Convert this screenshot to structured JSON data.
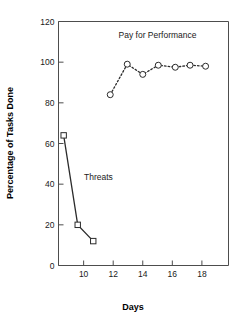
{
  "chart_data": {
    "type": "line",
    "title": "",
    "xlabel": "Days",
    "ylabel": "Percentage of Tasks Done",
    "xlim": [
      8.3,
      19.8
    ],
    "ylim": [
      0,
      120
    ],
    "xticks": [
      10,
      12,
      14,
      16,
      18
    ],
    "yticks": [
      0,
      20,
      40,
      60,
      80,
      100,
      120
    ],
    "xtick_labels": [
      "10",
      "12",
      "14",
      "16",
      "18"
    ],
    "ytick_labels": [
      "0",
      "20",
      "40",
      "60",
      "80",
      "100",
      "120"
    ],
    "grid": false,
    "legend": "annotations-inline",
    "series": [
      {
        "name": "Threats",
        "marker": "open-square",
        "linestyle": "solid",
        "color": "#2b2b2b",
        "label_position": {
          "x": 11.0,
          "y": 42
        },
        "points": [
          {
            "x": 8.65,
            "y": 64
          },
          {
            "x": 9.6,
            "y": 20
          },
          {
            "x": 10.65,
            "y": 12
          }
        ]
      },
      {
        "name": "Pay for Performance",
        "marker": "open-circle",
        "linestyle": "dotted",
        "color": "#2b2b2b",
        "label_position": {
          "x": 15.0,
          "y": 112
        },
        "points": [
          {
            "x": 11.8,
            "y": 84
          },
          {
            "x": 12.95,
            "y": 99
          },
          {
            "x": 14.0,
            "y": 94
          },
          {
            "x": 15.05,
            "y": 98.5
          },
          {
            "x": 16.2,
            "y": 97.5
          },
          {
            "x": 17.2,
            "y": 98.5
          },
          {
            "x": 18.25,
            "y": 98
          }
        ]
      }
    ]
  },
  "axes": {
    "x_axis_title": "Days",
    "y_axis_title": "Percentage of Tasks Done"
  },
  "annotations": {
    "threats_label": "Threats",
    "pay_for_performance_label": "Pay for Performance"
  },
  "colors": {
    "ink": "#2b2b2b",
    "frame": "#4d4d4d",
    "background": "#ffffff"
  }
}
